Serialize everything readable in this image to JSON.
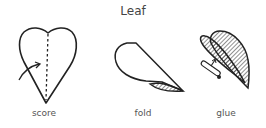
{
  "diagram": {
    "title": "Leaf",
    "steps": [
      {
        "label": "score",
        "icon": "heart-leaf-score-icon"
      },
      {
        "label": "fold",
        "icon": "leaf-fold-icon"
      },
      {
        "label": "glue",
        "icon": "leaf-glue-icon"
      }
    ],
    "colors": {
      "stroke": "#222222",
      "text": "#444444",
      "background": "#ffffff"
    }
  }
}
